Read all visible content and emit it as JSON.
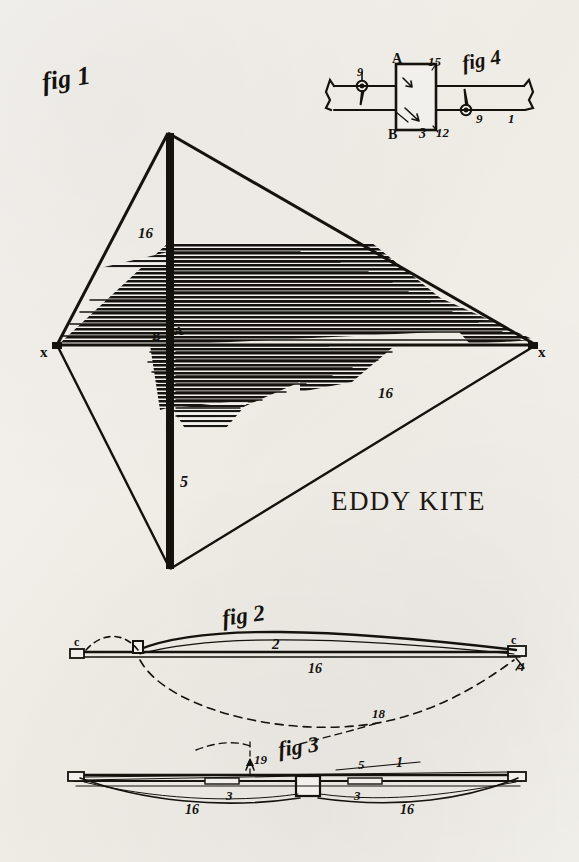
{
  "sheet": {
    "title": "EDDY KITE",
    "background_color": "#f2f0ec",
    "ink_color": "#14120d"
  },
  "figures": [
    {
      "id": "fig1",
      "caption": "fig 1",
      "description": "Front elevation of the Eddy kite: diamond frame with bowed horizontal cross-spar, vertical spine and hatched sail cloth",
      "labels": [
        "16",
        "B",
        "A",
        "x",
        "x",
        "16",
        "5"
      ]
    },
    {
      "id": "fig2",
      "caption": "fig 2",
      "description": "Side view of the bowed cross-spar with bridle line shown dashed",
      "labels": [
        "c",
        "2",
        "16",
        "c",
        "4",
        "18"
      ]
    },
    {
      "id": "fig3",
      "caption": "fig 3",
      "description": "Plan view of the cross-spar with central hub and bow cord",
      "labels": [
        "19",
        "5",
        "1",
        "3",
        "3",
        "16",
        "16"
      ]
    },
    {
      "id": "fig4",
      "caption": "fig 4",
      "description": "Detail of the central joint block showing spar ends, pins and tension springs",
      "labels": [
        "A",
        "15",
        "B",
        "3",
        "12",
        "9",
        "9",
        "1"
      ]
    }
  ],
  "fig1": {
    "caption": "fig 1",
    "label_16_top": "16",
    "label_B": "B",
    "label_A": "A",
    "label_x_left": "x",
    "label_x_right": "x",
    "label_16_lower": "16",
    "label_5": "5"
  },
  "fig2": {
    "caption": "fig 2",
    "label_c_left": "c",
    "label_2": "2",
    "label_16": "16",
    "label_c_right": "c",
    "label_4": "4",
    "label_18": "18"
  },
  "fig3": {
    "caption": "fig 3",
    "label_19": "19",
    "label_5": "5",
    "label_1": "1",
    "label_3_left": "3",
    "label_3_right": "3",
    "label_16_left": "16",
    "label_16_right": "16"
  },
  "fig4": {
    "caption": "fig 4",
    "label_A": "A",
    "label_15": "15",
    "label_B": "B",
    "label_3": "3",
    "label_12": "12",
    "label_9_left": "9",
    "label_9_right": "9",
    "label_1": "1"
  }
}
